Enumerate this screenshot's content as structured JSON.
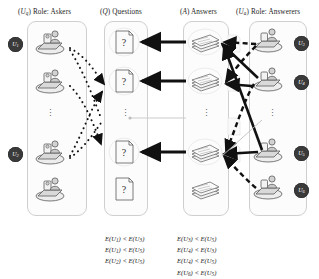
{
  "figure": {
    "type": "diagram"
  },
  "columns": [
    {
      "id": "askers",
      "prefix": "(U",
      "prefix_sub": "q",
      "prefix_close": ")",
      "label": "Role: Askers"
    },
    {
      "id": "questions",
      "prefix": "(Q",
      "prefix_sub": "",
      "prefix_close": ")",
      "label": "Questions"
    },
    {
      "id": "answers",
      "prefix": "(A",
      "prefix_sub": "",
      "prefix_close": ")",
      "label": "Answers"
    },
    {
      "id": "answerers",
      "prefix": "(U",
      "prefix_sub": "a",
      "prefix_close": ")",
      "label": "Role: Answerers"
    }
  ],
  "headers": {
    "askers": "(U q ) Role: Askers",
    "questions": "(Q) Questions",
    "answers": "(A) Answers",
    "answerers": "(U a ) Role: Answerers"
  },
  "asker_badges": [
    {
      "name": "U",
      "sub": "1",
      "row": 0
    },
    {
      "name": "U",
      "sub": "2",
      "row": 3
    }
  ],
  "answerer_badges": [
    {
      "name": "U",
      "sub": "3",
      "row": 0
    },
    {
      "name": "U",
      "sub": "4",
      "row": 1
    },
    {
      "name": "U",
      "sub": "5",
      "row": 3
    },
    {
      "name": "U",
      "sub": "6",
      "row": 4
    }
  ],
  "question_cards": [
    {
      "glyph": "?",
      "row": 0
    },
    {
      "glyph": "?",
      "row": 1
    },
    {
      "glyph": "?",
      "row": 3
    },
    {
      "glyph": "?",
      "row": 4
    }
  ],
  "answer_stacks": [
    {
      "row": 0
    },
    {
      "row": 1
    },
    {
      "row": 3
    },
    {
      "row": 4
    }
  ],
  "ellipsis_glyph": "⋮",
  "formulas": {
    "left": [
      "E(U1) < E(U3)",
      "E(U1) < E(U5)",
      "E(U2) < E(U5)"
    ],
    "right": [
      "E(U3) < E(U5)",
      "E(U4) < E(U3)",
      "E(U4) < E(U5)",
      "E(U6) < E(U5)"
    ],
    "left_parts": [
      {
        "lhs": "E(U",
        "lsub": "1",
        "op": " < ",
        "rhs": "E(U",
        "rsub": "3"
      },
      {
        "lhs": "E(U",
        "lsub": "1",
        "op": " < ",
        "rhs": "E(U",
        "rsub": "5"
      },
      {
        "lhs": "E(U",
        "lsub": "2",
        "op": " < ",
        "rhs": "E(U",
        "rsub": "5"
      }
    ],
    "right_parts": [
      {
        "lhs": "E(U",
        "lsub": "3",
        "op": " < ",
        "rhs": "E(U",
        "rsub": "5"
      },
      {
        "lhs": "E(U",
        "lsub": "4",
        "op": " < ",
        "rhs": "E(U",
        "rsub": "3"
      },
      {
        "lhs": "E(U",
        "lsub": "4",
        "op": " < ",
        "rhs": "E(U",
        "rsub": "5"
      },
      {
        "lhs": "E(U",
        "lsub": "6",
        "op": " < ",
        "rhs": "E(U",
        "rsub": "5"
      }
    ]
  },
  "colors": {
    "ink": "#1d1d1d",
    "badge": "#3a3a3a",
    "panel_border": "#cfcfcf",
    "arrow_solid": "#111111",
    "arrow_dotted": "#111111",
    "icon_line": "#4a4a4a",
    "icon_fill": "#dedede"
  },
  "edge_styles": {
    "askers_to_questions": "dotted",
    "answers_to_questions": "solid-thick",
    "answerers_to_answers": "mixed-solid-dashed"
  }
}
